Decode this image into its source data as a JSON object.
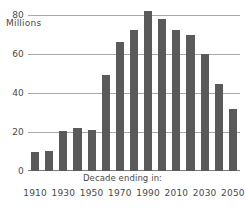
{
  "chart_data": {
    "type": "bar",
    "title": "",
    "subtitle": "",
    "xlabel": "Decade ending in:",
    "ylabel": "Millions",
    "ylim": [
      0,
      85
    ],
    "yticks": [
      0,
      20,
      40,
      60,
      80
    ],
    "ytick_labels": [
      "0",
      "20",
      "40",
      "60",
      "80"
    ],
    "grid": true,
    "legend": false,
    "bar_color": "#5a5a5a",
    "grid_color": "#a8a8a8",
    "text_color": "#4a4a4a",
    "categories": [
      "1910",
      "1920",
      "1930",
      "1940",
      "1950",
      "1960",
      "1970",
      "1980",
      "1990",
      "2000",
      "2010",
      "2020",
      "2030",
      "2040",
      "2050"
    ],
    "values": [
      9.5,
      10.5,
      20.5,
      22,
      21,
      49,
      66,
      72,
      82,
      78,
      72,
      69.5,
      60,
      44.5,
      32
    ],
    "labeled_categories": [
      "1910",
      "1930",
      "1950",
      "1970",
      "1990",
      "2010",
      "2030",
      "2050"
    ],
    "xtick_indices": [
      0,
      2,
      4,
      6,
      8,
      10,
      12,
      14
    ],
    "annotations": []
  }
}
